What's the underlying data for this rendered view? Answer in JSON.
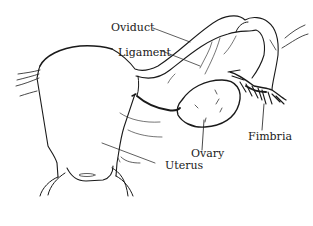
{
  "diagram": {
    "labels": {
      "oviduct": "Oviduct",
      "ligament": "Ligament",
      "fimbria": "Fimbria",
      "ovary": "Ovary",
      "uterus": "Uterus"
    },
    "colors": {
      "line": "#1a1a1a",
      "background": "#ffffff"
    }
  }
}
